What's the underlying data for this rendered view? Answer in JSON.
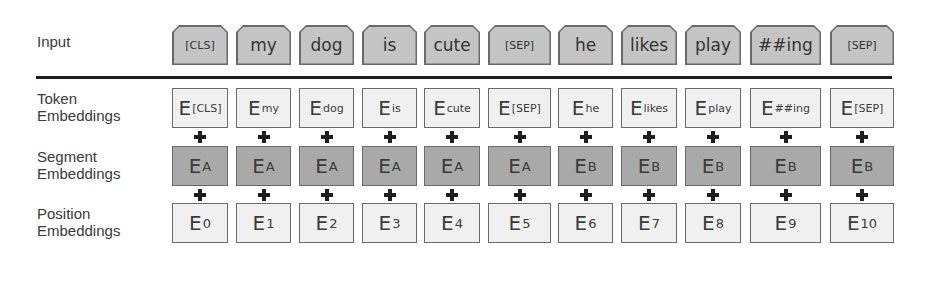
{
  "labels": {
    "input": "Input",
    "token": [
      "Token",
      "Embeddings"
    ],
    "segment": [
      "Segment",
      "Embeddings"
    ],
    "position": [
      "Position",
      "Embeddings"
    ]
  },
  "columns": [
    {
      "x": 172,
      "w": 56,
      "input": "[CLS]",
      "input_small": true,
      "token_sub": "[CLS]",
      "segment_sub": "A",
      "position_sub": "0"
    },
    {
      "x": 236,
      "w": 55,
      "input": "my",
      "input_small": false,
      "token_sub": "my",
      "segment_sub": "A",
      "position_sub": "1"
    },
    {
      "x": 299,
      "w": 55,
      "input": "dog",
      "input_small": false,
      "token_sub": "dog",
      "segment_sub": "A",
      "position_sub": "2"
    },
    {
      "x": 362,
      "w": 55,
      "input": "is",
      "input_small": false,
      "token_sub": "is",
      "segment_sub": "A",
      "position_sub": "3"
    },
    {
      "x": 424,
      "w": 56,
      "input": "cute",
      "input_small": false,
      "token_sub": "cute",
      "segment_sub": "A",
      "position_sub": "4"
    },
    {
      "x": 488,
      "w": 63,
      "input": "[SEP]",
      "input_small": true,
      "token_sub": "[SEP]",
      "segment_sub": "A",
      "position_sub": "5"
    },
    {
      "x": 558,
      "w": 55,
      "input": "he",
      "input_small": false,
      "token_sub": "he",
      "segment_sub": "B",
      "position_sub": "6"
    },
    {
      "x": 621,
      "w": 56,
      "input": "likes",
      "input_small": false,
      "token_sub": "likes",
      "segment_sub": "B",
      "position_sub": "7"
    },
    {
      "x": 685,
      "w": 56,
      "input": "play",
      "input_small": false,
      "token_sub": "play",
      "segment_sub": "B",
      "position_sub": "8"
    },
    {
      "x": 750,
      "w": 71,
      "input": "##ing",
      "input_small": false,
      "token_sub": "##ing",
      "segment_sub": "B",
      "position_sub": "9"
    },
    {
      "x": 830,
      "w": 64,
      "input": "[SEP]",
      "input_small": true,
      "token_sub": "[SEP]",
      "segment_sub": "B",
      "position_sub": "10"
    }
  ],
  "embedding_letter": "E",
  "colors": {
    "input_fill": "#c4c4c4",
    "token_fill": "#f0f0f0",
    "segment_fill": "#a9a9a9",
    "position_fill": "#f0f0f0",
    "border": "#6a6a6a",
    "divider": "#1e1e1e"
  }
}
